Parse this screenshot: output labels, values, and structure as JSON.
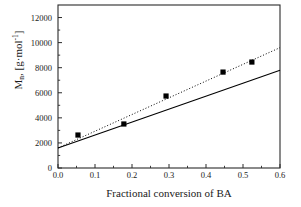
{
  "chart_data": {
    "type": "scatter",
    "title": "",
    "xlabel": "Fractional conversion of BA",
    "ylabel_main": "M",
    "ylabel_sub": "n",
    "ylabel_rest": ", [g·mol",
    "ylabel_sup": "-1",
    "ylabel_end": "]",
    "ylabel_full": "M n , [g·mol -1 ]",
    "xlim": [
      0.0,
      0.6
    ],
    "ylim": [
      0,
      13000
    ],
    "xticks": [
      "0.0",
      "0.1",
      "0.2",
      "0.3",
      "0.4",
      "0.5",
      "0.6"
    ],
    "xtick_values": [
      0.0,
      0.1,
      0.2,
      0.3,
      0.4,
      0.5,
      0.6
    ],
    "yticks": [
      "0",
      "2000",
      "4000",
      "6000",
      "8000",
      "10000",
      "12000"
    ],
    "ytick_values": [
      0,
      2000,
      4000,
      6000,
      8000,
      10000,
      12000
    ],
    "grid": false,
    "legend": null,
    "minor_ticks": true,
    "series": [
      {
        "name": "experimental Mn",
        "type": "scatter",
        "marker": "square",
        "color": "#000000",
        "points": [
          {
            "x": 0.054,
            "y": 2630
          },
          {
            "x": 0.178,
            "y": 3510
          },
          {
            "x": 0.292,
            "y": 5740
          },
          {
            "x": 0.446,
            "y": 7650
          },
          {
            "x": 0.524,
            "y": 8450
          }
        ]
      },
      {
        "name": "dotted fit line",
        "type": "line",
        "style": "dotted",
        "color": "#000000",
        "points": [
          {
            "x": 0.0,
            "y": 1600
          },
          {
            "x": 0.6,
            "y": 9600
          }
        ]
      },
      {
        "name": "solid theoretical line",
        "type": "line",
        "style": "solid",
        "color": "#000000",
        "points": [
          {
            "x": 0.0,
            "y": 1600
          },
          {
            "x": 0.6,
            "y": 7800
          }
        ]
      }
    ]
  }
}
